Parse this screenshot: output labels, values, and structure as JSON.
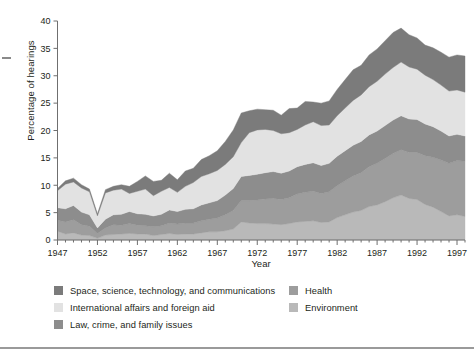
{
  "chart_data": {
    "type": "area",
    "stacked": true,
    "title": "",
    "xlabel": "Year",
    "ylabel": "Percentage of hearings",
    "xlim": [
      1947,
      1998
    ],
    "ylim": [
      0,
      40
    ],
    "ytick_step": 5,
    "yticks": [
      "0",
      "5",
      "10",
      "15",
      "20",
      "25",
      "30",
      "35",
      "40"
    ],
    "xticks": [
      "1947",
      "1952",
      "1957",
      "1962",
      "1967",
      "1972",
      "1977",
      "1982",
      "1987",
      "1992",
      "1997"
    ],
    "grid": false,
    "legend_position": "below",
    "x": [
      1947,
      1948,
      1949,
      1950,
      1951,
      1952,
      1953,
      1954,
      1955,
      1956,
      1957,
      1958,
      1959,
      1960,
      1961,
      1962,
      1963,
      1964,
      1965,
      1966,
      1967,
      1968,
      1969,
      1970,
      1971,
      1972,
      1973,
      1974,
      1975,
      1976,
      1977,
      1978,
      1979,
      1980,
      1981,
      1982,
      1983,
      1984,
      1985,
      1986,
      1987,
      1988,
      1989,
      1990,
      1991,
      1992,
      1993,
      1994,
      1995,
      1996,
      1997,
      1998
    ],
    "series": [
      {
        "name": "Environment",
        "color": "#b9b9b9",
        "stack_order": 1,
        "values": [
          1.6,
          1.1,
          1.3,
          0.9,
          0.8,
          0.3,
          0.9,
          1.0,
          1.1,
          1.2,
          1.1,
          1.1,
          0.8,
          1.0,
          1.2,
          1.0,
          1.1,
          1.1,
          1.3,
          1.5,
          1.5,
          1.7,
          2.0,
          3.3,
          3.1,
          3.0,
          3.0,
          2.9,
          2.8,
          3.0,
          3.3,
          3.4,
          3.5,
          3.2,
          3.3,
          4.1,
          4.6,
          5.1,
          5.4,
          6.1,
          6.4,
          7.0,
          7.7,
          8.2,
          7.6,
          7.4,
          6.5,
          6.0,
          5.2,
          4.4,
          4.6,
          4.3
        ]
      },
      {
        "name": "Health",
        "color": "#9d9d9d",
        "stack_order": 2,
        "values": [
          2.0,
          2.2,
          2.4,
          1.9,
          1.7,
          0.9,
          1.3,
          1.8,
          1.6,
          1.8,
          1.6,
          1.5,
          1.6,
          1.6,
          1.9,
          1.9,
          2.0,
          2.0,
          2.2,
          2.3,
          2.5,
          2.9,
          3.4,
          3.9,
          4.1,
          4.3,
          4.5,
          4.7,
          4.6,
          4.7,
          5.1,
          5.3,
          5.4,
          5.3,
          5.5,
          5.8,
          6.2,
          6.6,
          6.9,
          7.3,
          7.6,
          7.9,
          8.1,
          8.3,
          8.4,
          8.6,
          8.9,
          9.1,
          9.4,
          9.6,
          9.9,
          10.1
        ]
      },
      {
        "name": "Law, crime, and family issues",
        "color": "#8d8d8d",
        "stack_order": 3,
        "values": [
          2.3,
          2.4,
          2.6,
          2.3,
          2.1,
          1.0,
          1.6,
          1.8,
          2.0,
          2.2,
          2.1,
          2.1,
          2.0,
          2.1,
          2.4,
          2.3,
          2.5,
          2.6,
          2.9,
          3.0,
          3.2,
          3.6,
          4.0,
          4.4,
          4.6,
          4.7,
          4.8,
          4.9,
          4.8,
          4.9,
          5.0,
          5.1,
          5.2,
          5.1,
          5.2,
          5.4,
          5.5,
          5.6,
          5.7,
          5.8,
          5.9,
          6.0,
          6.1,
          6.2,
          6.1,
          6.0,
          5.8,
          5.6,
          5.3,
          5.0,
          4.8,
          4.6
        ]
      },
      {
        "name": "International affairs and foreign aid",
        "color": "#e2e2e2",
        "stack_order": 4,
        "values": [
          3.1,
          4.5,
          4.3,
          4.4,
          4.2,
          2.2,
          4.8,
          4.5,
          4.6,
          3.3,
          4.1,
          4.6,
          3.7,
          4.2,
          4.1,
          3.5,
          4.2,
          4.8,
          5.2,
          5.3,
          5.5,
          5.6,
          5.8,
          6.2,
          7.8,
          8.1,
          7.9,
          7.5,
          7.2,
          7.0,
          6.8,
          7.2,
          7.5,
          7.3,
          7.0,
          7.4,
          7.8,
          8.2,
          8.5,
          8.8,
          9.1,
          9.4,
          9.6,
          9.8,
          9.5,
          9.2,
          8.9,
          8.6,
          8.4,
          8.2,
          8.1,
          8.0
        ]
      },
      {
        "name": "Space, science, technology, and communications",
        "color": "#7b7b7b",
        "stack_order": 5,
        "values": [
          0.4,
          0.6,
          0.7,
          0.6,
          0.5,
          0.4,
          0.6,
          0.7,
          0.8,
          1.3,
          1.8,
          2.4,
          2.6,
          2.0,
          2.6,
          2.3,
          2.8,
          2.6,
          3.1,
          3.3,
          3.6,
          4.2,
          4.9,
          5.4,
          4.0,
          3.8,
          3.6,
          3.7,
          3.4,
          4.4,
          3.9,
          4.3,
          3.6,
          4.1,
          4.4,
          4.8,
          5.2,
          5.6,
          5.4,
          5.8,
          5.9,
          6.1,
          6.4,
          6.2,
          5.9,
          5.7,
          5.5,
          5.8,
          6.0,
          6.2,
          6.4,
          6.6
        ]
      }
    ]
  },
  "axis": {
    "ylabel": "Percentage of hearings",
    "xlabel": "Year"
  },
  "legend": {
    "left_column": [
      {
        "label": "Space, science, technology, and communications",
        "color": "#7b7b7b",
        "icon": "legend-swatch-icon"
      },
      {
        "label": "International affairs and foreign aid",
        "color": "#e2e2e2",
        "icon": "legend-swatch-icon"
      },
      {
        "label": "Law, crime, and family issues",
        "color": "#8d8d8d",
        "icon": "legend-swatch-icon"
      }
    ],
    "right_column": [
      {
        "label": "Health",
        "color": "#9d9d9d",
        "icon": "legend-swatch-icon"
      },
      {
        "label": "Environment",
        "color": "#b9b9b9",
        "icon": "legend-swatch-icon"
      }
    ]
  },
  "colors": {
    "axis": "#6f6f6f",
    "text": "#231f20",
    "rule": "#9a9a9a",
    "background": "#ffffff"
  }
}
